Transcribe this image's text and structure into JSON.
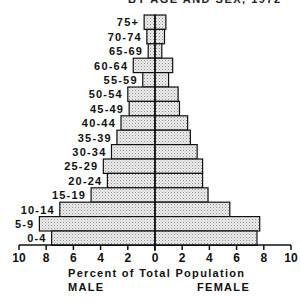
{
  "title": "BY AGE AND SEX, 1972",
  "chart_data": {
    "type": "bar",
    "orientation": "horizontal-population-pyramid",
    "title": "BY AGE AND SEX, 1972",
    "xlabel": "Percent of Total Population",
    "left_label": "MALE",
    "right_label": "FEMALE",
    "xlim": [
      -10,
      10
    ],
    "x_ticks": [
      "10",
      "8",
      "6",
      "4",
      "2",
      "0",
      "2",
      "4",
      "6",
      "8",
      "10"
    ],
    "grid": false,
    "legend": "none",
    "categories": [
      "75+",
      "70-74",
      "65-69",
      "60-64",
      "55-59",
      "50-54",
      "45-49",
      "40-44",
      "35-39",
      "30-34",
      "25-29",
      "20-24",
      "15-19",
      "10-14",
      "5-9",
      "0-4"
    ],
    "series": [
      {
        "name": "MALE",
        "values": [
          0.8,
          0.6,
          0.5,
          1.6,
          0.9,
          2.0,
          1.9,
          2.5,
          2.8,
          3.2,
          3.8,
          3.5,
          4.7,
          7.0,
          8.5,
          7.6
        ]
      },
      {
        "name": "FEMALE",
        "values": [
          0.8,
          0.7,
          0.5,
          1.3,
          1.0,
          1.7,
          1.8,
          2.4,
          2.6,
          3.1,
          3.5,
          3.5,
          3.9,
          5.5,
          7.7,
          7.5
        ]
      }
    ],
    "colors": {
      "bar_fill": "#d9d9d9",
      "bar_stroke": "#111111",
      "axis": "#111111"
    }
  }
}
